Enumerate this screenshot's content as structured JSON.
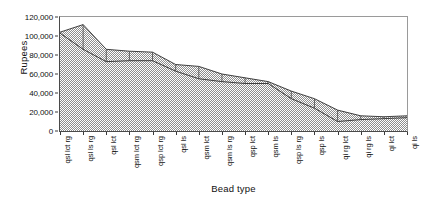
{
  "chart_data": {
    "type": "area",
    "title": "",
    "xlabel": "Bead type",
    "ylabel": "Rupees",
    "grid": false,
    "legend": "none",
    "ylim": [
      0,
      120000
    ],
    "ytick_labels": [
      "120,000",
      "100,000",
      "80,000",
      "60,000",
      "40,000",
      "20,000",
      "0"
    ],
    "ytick_values": [
      120000,
      100000,
      80000,
      60000,
      40000,
      20000,
      0
    ],
    "categories": [
      "qsl lct rg",
      "qsl ls rg",
      "qsl lct",
      "qsm lct rg",
      "qsp lct rg",
      "qsl ls",
      "qsm lct",
      "qsm ls rg",
      "qsp lct",
      "qsm ls",
      "qsp ls rg",
      "qsp ls",
      "qi rg lct",
      "qi rg ls",
      "qi lct",
      "qi ls"
    ],
    "series": [
      {
        "name": "upper",
        "values": [
          104000,
          112000,
          86000,
          84000,
          83000,
          70000,
          68000,
          60000,
          56000,
          52000,
          42000,
          34000,
          22000,
          16000,
          15000,
          16000
        ]
      },
      {
        "name": "lower",
        "values": [
          103000,
          86000,
          73000,
          74000,
          74000,
          63000,
          55000,
          52000,
          50000,
          50000,
          34000,
          24000,
          10000,
          12000,
          13000,
          14000
        ]
      }
    ]
  },
  "axes": {
    "y_title": "Rupees",
    "x_title": "Bead type"
  }
}
